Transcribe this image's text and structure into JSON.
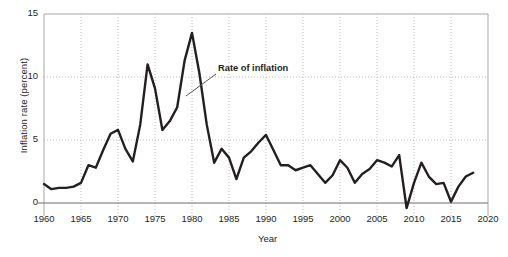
{
  "chart_data": {
    "type": "line",
    "title": "",
    "xlabel": "Year",
    "ylabel": "Inflation rate (percent)",
    "xlim": [
      1960,
      2020
    ],
    "ylim": [
      0,
      15
    ],
    "ylim_display_min": -1.0,
    "yticks": [
      0,
      5,
      10,
      15
    ],
    "ytick_labels": [
      "0",
      "5",
      "10",
      "15"
    ],
    "xticks": [
      1960,
      1965,
      1970,
      1975,
      1980,
      1985,
      1990,
      1995,
      2000,
      2005,
      2010,
      2015,
      2020
    ],
    "xtick_labels": [
      "1960",
      "1965",
      "1970",
      "1975",
      "1980",
      "1985",
      "1990",
      "1995",
      "2000",
      "2005",
      "2010",
      "2015",
      "2020"
    ],
    "grid": "dotted vertical gridlines at every x tick; dotted horizontal gridlines at y = 5 and y = 10; solid baseline at y = 0",
    "legend": null,
    "annotations": [
      {
        "text": "Rate of inflation",
        "x_px": 218,
        "y_px": 63,
        "leader_line": {
          "from_x_px": 216,
          "from_y_px": 74,
          "to_x_px": 186,
          "to_y_px": 96
        }
      }
    ],
    "series": [
      {
        "name": "Rate of inflation",
        "color": "#231f20",
        "line_width": 2.4,
        "x": [
          1960,
          1961,
          1962,
          1963,
          1964,
          1965,
          1966,
          1967,
          1968,
          1969,
          1970,
          1971,
          1972,
          1973,
          1974,
          1975,
          1976,
          1977,
          1978,
          1979,
          1980,
          1981,
          1982,
          1983,
          1984,
          1985,
          1986,
          1987,
          1988,
          1989,
          1990,
          1991,
          1992,
          1993,
          1994,
          1995,
          1996,
          1997,
          1998,
          1999,
          2000,
          2001,
          2002,
          2003,
          2004,
          2005,
          2006,
          2007,
          2008,
          2009,
          2010,
          2011,
          2012,
          2013,
          2014,
          2015,
          2016,
          2017,
          2018
        ],
        "values": [
          1.5,
          1.1,
          1.2,
          1.2,
          1.3,
          1.6,
          3.0,
          2.8,
          4.2,
          5.5,
          5.8,
          4.3,
          3.3,
          6.2,
          11.0,
          9.1,
          5.8,
          6.5,
          7.6,
          11.3,
          13.5,
          10.3,
          6.2,
          3.2,
          4.3,
          3.6,
          1.9,
          3.6,
          4.1,
          4.8,
          5.4,
          4.2,
          3.0,
          3.0,
          2.6,
          2.8,
          3.0,
          2.3,
          1.6,
          2.2,
          3.4,
          2.8,
          1.6,
          2.3,
          2.7,
          3.4,
          3.2,
          2.9,
          3.8,
          -0.4,
          1.6,
          3.2,
          2.1,
          1.5,
          1.6,
          0.1,
          1.3,
          2.1,
          2.4
        ]
      }
    ]
  },
  "axis": {
    "y_title": "Inflation rate (percent)",
    "x_title": "Year"
  }
}
